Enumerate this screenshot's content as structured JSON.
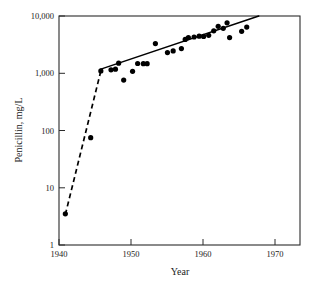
{
  "chart_data": {
    "type": "scatter",
    "title": "",
    "xlabel": "Year",
    "ylabel": "Penicillin, mg/L",
    "xlim": [
      1940,
      1978
    ],
    "ylim": [
      1,
      10000
    ],
    "yscale": "log",
    "xscale": "linear",
    "grid": false,
    "legend": null,
    "xticks": [
      1940,
      1950,
      1960,
      1970
    ],
    "xtick_labels": [
      "1940",
      "1950",
      "1960",
      "1970"
    ],
    "yticks": [
      1,
      10,
      100,
      1000,
      10000
    ],
    "ytick_labels": [
      "1",
      "10",
      "100",
      "1,000",
      "10,000"
    ],
    "series": [
      {
        "name": "Penicillin titer",
        "marker": "filled-circle",
        "color": "#000000",
        "points": [
          {
            "x": 1941.0,
            "y": 3.5
          },
          {
            "x": 1945.0,
            "y": 75
          },
          {
            "x": 1946.6,
            "y": 1100
          },
          {
            "x": 1948.2,
            "y": 1150
          },
          {
            "x": 1948.9,
            "y": 1180
          },
          {
            "x": 1949.4,
            "y": 1500
          },
          {
            "x": 1950.2,
            "y": 760
          },
          {
            "x": 1951.6,
            "y": 1080
          },
          {
            "x": 1952.4,
            "y": 1480
          },
          {
            "x": 1953.3,
            "y": 1470
          },
          {
            "x": 1953.9,
            "y": 1470
          },
          {
            "x": 1955.2,
            "y": 3300
          },
          {
            "x": 1957.1,
            "y": 2300
          },
          {
            "x": 1958.0,
            "y": 2450
          },
          {
            "x": 1959.3,
            "y": 2700
          },
          {
            "x": 1959.9,
            "y": 3900
          },
          {
            "x": 1960.4,
            "y": 4200
          },
          {
            "x": 1961.3,
            "y": 4300
          },
          {
            "x": 1962.1,
            "y": 4450
          },
          {
            "x": 1962.8,
            "y": 4400
          },
          {
            "x": 1963.6,
            "y": 4600
          },
          {
            "x": 1964.4,
            "y": 5500
          },
          {
            "x": 1965.1,
            "y": 6600
          },
          {
            "x": 1965.9,
            "y": 6100
          },
          {
            "x": 1966.5,
            "y": 7600
          },
          {
            "x": 1966.9,
            "y": 4200
          },
          {
            "x": 1968.8,
            "y": 5400
          },
          {
            "x": 1969.6,
            "y": 6400
          }
        ]
      }
    ],
    "fit_lines": [
      {
        "name": "early-phase-fit",
        "style": "dashed",
        "color": "#000000",
        "start": {
          "x": 1941.0,
          "y": 3.4
        },
        "end": {
          "x": 1946.6,
          "y": 1100
        }
      },
      {
        "name": "late-phase-fit",
        "style": "solid",
        "color": "#000000",
        "start": {
          "x": 1946.6,
          "y": 1180
        },
        "end": {
          "x": 1971.5,
          "y": 10000
        }
      }
    ],
    "annotations": []
  },
  "axes": {
    "x_title": "Year",
    "y_title": "Penicillin, mg/L"
  }
}
